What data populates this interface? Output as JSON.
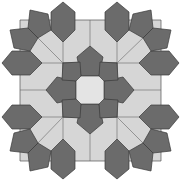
{
  "figure": {
    "colors": {
      "dark": "#6b6b6b",
      "light": "#d6d6d6",
      "center": "#e4e4e4",
      "stroke": "#3a3a3a",
      "background": "#ffffff"
    },
    "center": [
      90,
      90
    ],
    "elements": {
      "center_octagon": "center octagon",
      "inner_star": "8 dark pentagons forming a star",
      "light_ring": "light grey quadrilateral tiles",
      "outer_pentagons": "dark pentagon pairs on edges and corners"
    }
  }
}
